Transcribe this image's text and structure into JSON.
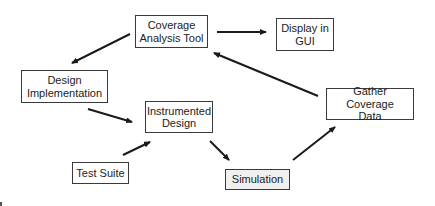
{
  "diagram": {
    "type": "flow",
    "nodes": [
      {
        "id": "coverage_tool",
        "label": "Coverage\nAnalysis Tool",
        "x": 135,
        "y": 15,
        "w": 73,
        "h": 33,
        "fill": "#ffffff"
      },
      {
        "id": "display_gui",
        "label": "Display in\nGUI",
        "x": 276,
        "y": 18,
        "w": 58,
        "h": 33,
        "fill": "#ffffff"
      },
      {
        "id": "design_impl",
        "label": "Design\nImplementation",
        "x": 21,
        "y": 70,
        "w": 87,
        "h": 33,
        "fill": "#ffffff"
      },
      {
        "id": "instrumented",
        "label": "Instrumented\nDesign",
        "x": 145,
        "y": 101,
        "w": 68,
        "h": 32,
        "fill": "#ffffff"
      },
      {
        "id": "test_suite",
        "label": "Test Suite",
        "x": 72,
        "y": 162,
        "w": 57,
        "h": 22,
        "fill": "#ffffff"
      },
      {
        "id": "simulation",
        "label": "Simulation",
        "x": 225,
        "y": 169,
        "w": 65,
        "h": 21,
        "fill": "#f0f0f0"
      },
      {
        "id": "gather",
        "label": "Gather Coverage\nData",
        "x": 326,
        "y": 88,
        "w": 88,
        "h": 32,
        "fill": "#ffffff"
      }
    ],
    "edges": [
      {
        "from": "coverage_tool",
        "to": "display_gui",
        "x1": 217,
        "y1": 32,
        "x2": 266,
        "y2": 32
      },
      {
        "from": "coverage_tool",
        "to": "design_impl",
        "x1": 130,
        "y1": 34,
        "x2": 72,
        "y2": 63
      },
      {
        "from": "design_impl",
        "to": "instrumented",
        "x1": 88,
        "y1": 109,
        "x2": 132,
        "y2": 122
      },
      {
        "from": "test_suite",
        "to": "instrumented",
        "x1": 123,
        "y1": 155,
        "x2": 150,
        "y2": 142
      },
      {
        "from": "instrumented",
        "to": "simulation",
        "x1": 210,
        "y1": 141,
        "x2": 229,
        "y2": 160
      },
      {
        "from": "simulation",
        "to": "gather",
        "x1": 293,
        "y1": 160,
        "x2": 335,
        "y2": 127
      },
      {
        "from": "gather",
        "to": "coverage_tool",
        "x1": 318,
        "y1": 96,
        "x2": 214,
        "y2": 53
      }
    ],
    "line_color": "#1a1a1a"
  }
}
